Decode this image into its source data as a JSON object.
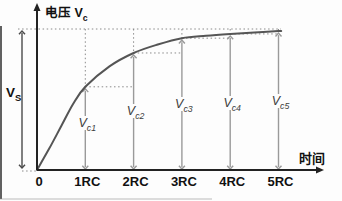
{
  "figure": {
    "y_axis_label": {
      "pre": "电压 V",
      "sub": "c"
    },
    "x_axis_label": "时间",
    "vs_label": {
      "pre": "V",
      "sub": "S"
    }
  },
  "colors": {
    "background": "#fdfdfd",
    "axis": "#222222",
    "text": "#111111",
    "curve": "#555555",
    "marker_arrow": "#9a9a9a",
    "marker_text": "#3c3c3c",
    "dotted": "#8a8a8a",
    "vs_arrow": "#4a4a4a"
  },
  "chart_data": {
    "type": "line",
    "title": "",
    "xlabel": "时间",
    "ylabel": "电压 Vc",
    "x_unit": "RC",
    "grid": false,
    "legend": false,
    "xlim_RC": [
      0,
      5.9
    ],
    "y_asymptote": {
      "label": "VS",
      "value_frac_of_VS": 1.0,
      "style": "dotted"
    },
    "x_ticks": [
      {
        "t": 0,
        "label": "0"
      },
      {
        "t": 1,
        "label": "1RC"
      },
      {
        "t": 2,
        "label": "2RC"
      },
      {
        "t": 3,
        "label": "3RC"
      },
      {
        "t": 4,
        "label": "4RC"
      },
      {
        "t": 5,
        "label": "5RC"
      }
    ],
    "markers": [
      {
        "label": {
          "pre": "V",
          "sub": "c1"
        },
        "t": 1,
        "v_frac": 0.59
      },
      {
        "label": {
          "pre": "V",
          "sub": "c2"
        },
        "t": 2,
        "v_frac": 0.83
      },
      {
        "label": {
          "pre": "V",
          "sub": "c3"
        },
        "t": 3,
        "v_frac": 0.935
      },
      {
        "label": {
          "pre": "V",
          "sub": "c4"
        },
        "t": 4,
        "v_frac": 0.965
      },
      {
        "label": {
          "pre": "V",
          "sub": "c5"
        },
        "t": 5,
        "v_frac": 0.985
      }
    ],
    "curve_points": [
      [
        0,
        0
      ],
      [
        0.25,
        0.15
      ],
      [
        0.5,
        0.31
      ],
      [
        0.75,
        0.47
      ],
      [
        1,
        0.59
      ],
      [
        1.5,
        0.735
      ],
      [
        2,
        0.83
      ],
      [
        2.5,
        0.89
      ],
      [
        3,
        0.935
      ],
      [
        3.5,
        0.952
      ],
      [
        4,
        0.965
      ],
      [
        4.5,
        0.976
      ],
      [
        5,
        0.985
      ],
      [
        5.05,
        0.986
      ]
    ]
  }
}
